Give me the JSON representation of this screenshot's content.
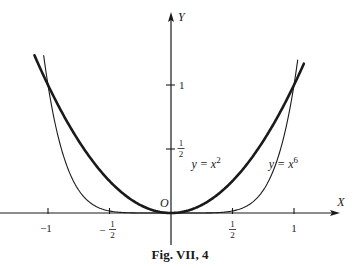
{
  "chart_data": {
    "type": "line",
    "title": "",
    "caption": "Fig. VII, 4",
    "xlabel": "X",
    "ylabel": "Y",
    "origin_label": "O",
    "xlim": [
      -1.11,
      1.11
    ],
    "ylim": [
      -0.25,
      1.25
    ],
    "grid": false,
    "legend": "none",
    "x_ticks": [
      {
        "value": -1,
        "label": "−1",
        "num": "",
        "den": ""
      },
      {
        "value": -0.5,
        "label": "−",
        "num": "1",
        "den": "2"
      },
      {
        "value": 0.5,
        "label": "",
        "num": "1",
        "den": "2"
      },
      {
        "value": 1,
        "label": "1",
        "num": "",
        "den": ""
      }
    ],
    "y_ticks": [
      {
        "value": 0.5,
        "label": "",
        "num": "1",
        "den": "2"
      },
      {
        "value": 1,
        "label": "1",
        "num": "",
        "den": ""
      }
    ],
    "series": [
      {
        "name": "y = x^2",
        "label_main": "y = x",
        "label_exp": "2",
        "weight": "thick",
        "exponent": 2,
        "x_range": [
          -1.11,
          1.08
        ],
        "label_at": [
          0.28,
          0.38
        ],
        "x": [
          -1.11,
          -1.0,
          -0.75,
          -0.5,
          -0.25,
          0,
          0.25,
          0.5,
          0.75,
          1.0,
          1.08
        ],
        "y": [
          1.232,
          1.0,
          0.5625,
          0.25,
          0.0625,
          0,
          0.0625,
          0.25,
          0.5625,
          1.0,
          1.166
        ]
      },
      {
        "name": "y = x^6",
        "label_main": "y = x",
        "label_exp": "6",
        "weight": "thin",
        "exponent": 6,
        "x_range": [
          -1.035,
          1.03
        ],
        "label_at": [
          0.86,
          0.38
        ],
        "x": [
          -1.035,
          -1.0,
          -0.9,
          -0.75,
          -0.5,
          -0.25,
          0,
          0.25,
          0.5,
          0.75,
          0.9,
          1.0,
          1.03
        ],
        "y": [
          1.229,
          1.0,
          0.531,
          0.178,
          0.0156,
          0.0002,
          0,
          0.0002,
          0.0156,
          0.178,
          0.531,
          1.0,
          1.194
        ]
      }
    ]
  }
}
